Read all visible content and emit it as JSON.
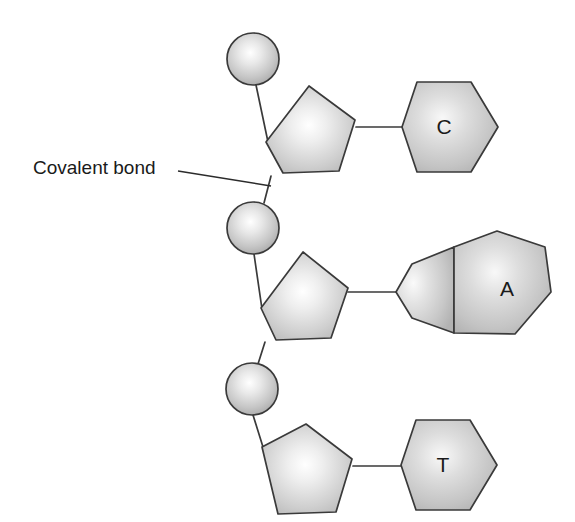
{
  "diagram": {
    "background_color": "#ffffff",
    "stroke_color": "#3a3a3a",
    "fill_light": "#fdfdfd",
    "fill_mid": "#cfcfcf",
    "fill_dark": "#a8a8a8",
    "annotations": [
      {
        "id": "covalent-bond",
        "label": "Covalent bond",
        "text_x": 33,
        "text_y": 166,
        "leader_from_x": 178,
        "leader_from_y": 171,
        "leader_to_x": 271,
        "leader_to_y": 186
      }
    ],
    "nucleotides": [
      {
        "id": "nucleotide-c",
        "base_letter": "C",
        "base_type": "pyrimidine",
        "base_letter_x": 444,
        "base_letter_y": 124,
        "phosphate": {
          "cx": 253,
          "cy": 59,
          "r": 26
        },
        "sugar_center": {
          "x": 311,
          "y": 129
        },
        "base_center": {
          "x": 444,
          "y": 124
        }
      },
      {
        "id": "nucleotide-a",
        "base_letter": "A",
        "base_type": "purine",
        "base_letter_x": 507,
        "base_letter_y": 286,
        "phosphate": {
          "cx": 253,
          "cy": 228,
          "r": 26
        },
        "sugar_center": {
          "x": 305,
          "y": 295
        },
        "base_center": {
          "x": 480,
          "y": 288
        }
      },
      {
        "id": "nucleotide-t",
        "base_letter": "T",
        "base_type": "pyrimidine",
        "base_letter_x": 443,
        "base_letter_y": 462,
        "phosphate": {
          "cx": 252,
          "cy": 389,
          "r": 26
        },
        "sugar_center": {
          "x": 308,
          "y": 468
        },
        "base_center": {
          "x": 443,
          "y": 462
        }
      }
    ]
  }
}
